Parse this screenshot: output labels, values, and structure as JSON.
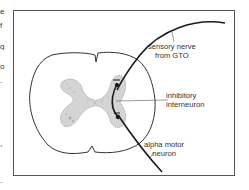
{
  "figure": {
    "labels": {
      "sensory_nerve": [
        "sensory nerve",
        "from GTO"
      ],
      "inhibitory_interneuron": [
        "inhibitory",
        "interneuron"
      ],
      "alpha_motor_neuron": [
        "alpha motor",
        "neuron"
      ]
    },
    "colors": {
      "line": "#1a1a1a",
      "outline": "#333333",
      "grey_matter": "#c8c8c8",
      "border": "#555555",
      "text": "#333333"
    }
  },
  "left_margin_fragments": [
    "e",
    "f",
    "g",
    "o",
    ".",
    ",",
    "."
  ]
}
